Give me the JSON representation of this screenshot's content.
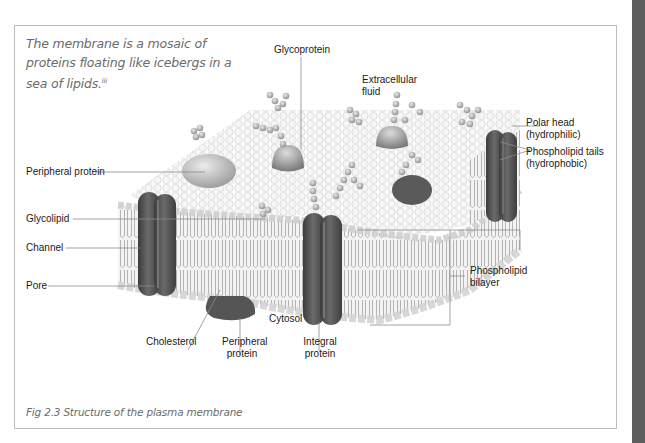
{
  "figure": {
    "quote": "The membrane is a mosaic of proteins floating like icebergs in a sea of lipids.",
    "quote_footnote": "iii",
    "caption": "Fig 2.3 Structure of the plasma membrane"
  },
  "labels": {
    "glycoprotein": "Glycoprotein",
    "extracellular_fluid_1": "Extracellular",
    "extracellular_fluid_2": "fluid",
    "polar_head_1": "Polar head",
    "polar_head_2": "(hydrophilic)",
    "phospholipid_tails_1": "Phospholipid tails",
    "phospholipid_tails_2": "(hydrophobic)",
    "peripheral_protein_left": "Peripheral protein",
    "glycolipid": "Glycolipid",
    "channel": "Channel",
    "pore": "Pore",
    "phospholipid_bilayer_1": "Phospholipid",
    "phospholipid_bilayer_2": "bilayer",
    "cytosol": "Cytosol",
    "cholesterol": "Cholesterol",
    "peripheral_protein_bottom_1": "Peripheral",
    "peripheral_protein_bottom_2": "protein",
    "integral_protein_1": "Integral",
    "integral_protein_2": "protein"
  },
  "colors": {
    "frame_border": "#bdbdbd",
    "side_strip": "#5e5e5e",
    "text_italic": "#6b6b6b",
    "leader_line": "#8a8a8a",
    "protein_dark": "#4a4a4a"
  }
}
